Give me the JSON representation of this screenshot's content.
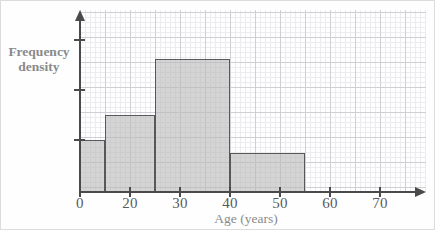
{
  "figure": {
    "kind": "histogram",
    "background_color": "#fefefe",
    "bar_fill_color": "#b9b9b9",
    "bar_stroke_color": "#585858",
    "axis_color": "#4a4a4a",
    "grid_major_color": "#cfcfd6",
    "grid_minor_color": "#ececf0",
    "label_color": "#8a8a8a",
    "tick_label_color": "#5a5a5a"
  },
  "axes": {
    "y_title_line1": "Frequency",
    "y_title_line2": "density",
    "x_title": "Age (years)",
    "x_tick_labels": [
      "0",
      "20",
      "30",
      "40",
      "50",
      "60",
      "70"
    ],
    "x_tick_values": [
      0,
      20,
      30,
      40,
      50,
      60,
      70
    ],
    "y_tick_labels": [
      "",
      "",
      ""
    ],
    "y_tick_count": 3
  },
  "chart_data": {
    "type": "bar",
    "title": "",
    "subtitle": "",
    "xlabel": "Age (years)",
    "ylabel": "Frequency density",
    "xlim": [
      0,
      70
    ],
    "ylim": [
      0,
      3
    ],
    "grid": true,
    "legend": "none",
    "note": "Histogram with unequal class widths; y axis is frequency density with unlabelled ticks at 1, 2 and 3 units.",
    "bins": [
      {
        "label": "20-25",
        "x_start": 20,
        "x_end": 25,
        "width": 5,
        "frequency_density": 1.0,
        "frequency": 5
      },
      {
        "label": "25-35",
        "x_start": 25,
        "x_end": 35,
        "width": 10,
        "frequency_density": 1.5,
        "frequency": 15
      },
      {
        "label": "35-50",
        "x_start": 35,
        "x_end": 50,
        "width": 15,
        "frequency_density": 2.65,
        "frequency": 40
      },
      {
        "label": "50-65",
        "x_start": 50,
        "x_end": 65,
        "width": 15,
        "frequency_density": 0.76,
        "frequency": 11
      }
    ],
    "categories": [
      "20-25",
      "25-35",
      "35-50",
      "50-65"
    ],
    "values": [
      1.0,
      1.5,
      2.65,
      0.76
    ]
  },
  "geometry": {
    "origin_px": {
      "x": 79,
      "y": 191
    },
    "px_per_year": 5,
    "px_per_density_unit": 50,
    "bars_px": [
      {
        "left": 79,
        "top": 139,
        "width": 25,
        "height": 52
      },
      {
        "left": 104,
        "top": 114,
        "width": 50,
        "height": 77
      },
      {
        "left": 154,
        "top": 58,
        "width": 75,
        "height": 133
      },
      {
        "left": 229,
        "top": 152,
        "width": 75,
        "height": 39
      }
    ],
    "x_tick_px": [
      79,
      129,
      179,
      229,
      279,
      329,
      379
    ],
    "y_tick_px": [
      139,
      89,
      39
    ]
  }
}
